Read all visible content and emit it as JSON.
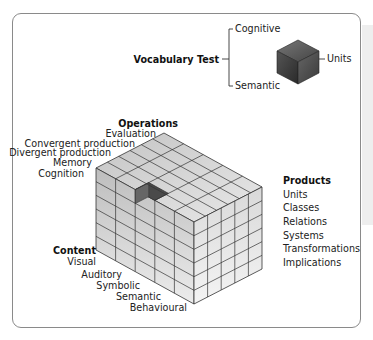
{
  "vocab": {
    "test_label": "Vocabulary Test",
    "operation": "Cognitive",
    "content": "Semantic",
    "product": "Units"
  },
  "axes": {
    "operations": {
      "title": "Operations",
      "items": [
        "Evaluation",
        "Convergent production",
        "Divergent production",
        "Memory",
        "Cognition"
      ]
    },
    "products": {
      "title": "Products",
      "items": [
        "Units",
        "Classes",
        "Relations",
        "Systems",
        "Transformations",
        "Implications"
      ]
    },
    "content": {
      "title": "Content",
      "items": [
        "Visual",
        "Auditory",
        "Symbolic",
        "Semantic",
        "Behavioural"
      ]
    }
  },
  "colors": {
    "frame": "#8a8a8a",
    "grid_line": "#333333",
    "top_face": "#d4d4d4",
    "left_face": "#c6c6c6",
    "right_face": "#e6e6e6",
    "highlight_cell": "#555555"
  }
}
